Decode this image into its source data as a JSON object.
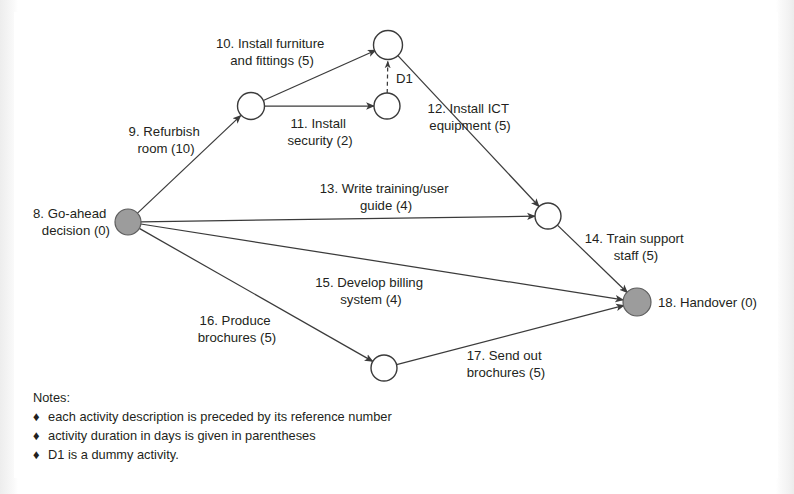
{
  "figure": {
    "type": "activity-on-arrow network diagram",
    "background_color": "#ffffff",
    "line_color": "#3b3b3b",
    "milestone_fill_color": "#9c9c9c",
    "event_fill_color": "#ffffff"
  },
  "nodes": [
    {
      "id": "n8",
      "label": "8. Go-ahead\ndecision (0)",
      "label_line1": "8. Go-ahead",
      "label_line2": "decision (0)",
      "style": "filled",
      "cx": 128,
      "cy": 222,
      "r": 13
    },
    {
      "id": "nA",
      "label": "",
      "style": "open",
      "cx": 251,
      "cy": 106,
      "r": 13.5
    },
    {
      "id": "nB",
      "label": "",
      "style": "open",
      "cx": 388,
      "cy": 45,
      "r": 14.5
    },
    {
      "id": "nC",
      "label": "",
      "style": "open",
      "cx": 387,
      "cy": 106,
      "r": 13
    },
    {
      "id": "nD",
      "label": "",
      "style": "open",
      "cx": 548,
      "cy": 216,
      "r": 13
    },
    {
      "id": "nE",
      "label": "",
      "style": "open",
      "cx": 384,
      "cy": 368,
      "r": 13
    },
    {
      "id": "n18",
      "label": "18. Handover (0)",
      "style": "filled",
      "cx": 637,
      "cy": 302,
      "r": 14
    }
  ],
  "node_labels": [
    {
      "id": "label-8",
      "lines": [
        "8. Go-ahead",
        "decision (0)"
      ],
      "anchor": "end",
      "x": 110,
      "y": 218
    },
    {
      "id": "label-18",
      "lines": [
        "18. Handover (0)"
      ],
      "anchor": "start",
      "x": 658,
      "y": 307
    }
  ],
  "activities": [
    {
      "ref": "9",
      "name": "Refurbish room",
      "duration": 10,
      "lines": [
        "9. Refurbish",
        "room (10)"
      ],
      "from": "n8",
      "to": "nA",
      "label_x": 166,
      "label_y": 136,
      "anchor": "middle"
    },
    {
      "ref": "10",
      "name": "Install furniture and fittings",
      "duration": 5,
      "lines": [
        "10. Install furniture",
        "and fittings (5)"
      ],
      "from": "nA",
      "to": "nB",
      "label_x": 272,
      "label_y": 48,
      "anchor": "middle"
    },
    {
      "ref": "11",
      "name": "Install security",
      "duration": 2,
      "lines": [
        "11. Install",
        "security (2)"
      ],
      "from": "nA",
      "to": "nC",
      "label_x": 320,
      "label_y": 128,
      "anchor": "middle"
    },
    {
      "ref": "12",
      "name": "Install ICT equipment",
      "duration": 5,
      "lines": [
        "12. Install ICT",
        "equipment (5)"
      ],
      "from": "nB",
      "to": "nD",
      "label_x": 470,
      "label_y": 113,
      "anchor": "middle"
    },
    {
      "ref": "13",
      "name": "Write training/user guide",
      "duration": 4,
      "lines": [
        "13. Write training/user",
        "guide (4)"
      ],
      "from": "n8",
      "to": "nD",
      "label_x": 386,
      "label_y": 193,
      "anchor": "middle"
    },
    {
      "ref": "14",
      "name": "Train support staff",
      "duration": 5,
      "lines": [
        "14. Train support",
        "staff (5)"
      ],
      "from": "nD",
      "to": "n18",
      "label_x": 636,
      "label_y": 243,
      "anchor": "middle"
    },
    {
      "ref": "15",
      "name": "Develop billing system",
      "duration": 4,
      "lines": [
        "15. Develop billing",
        "system (4)"
      ],
      "from": "n8",
      "to": "n18",
      "label_x": 371,
      "label_y": 287,
      "anchor": "middle"
    },
    {
      "ref": "16",
      "name": "Produce brochures",
      "duration": 5,
      "lines": [
        "16. Produce",
        "brochures (5)"
      ],
      "from": "n8",
      "to": "nE",
      "label_x": 237,
      "label_y": 325,
      "anchor": "middle"
    },
    {
      "ref": "17",
      "name": "Send out brochures",
      "duration": 5,
      "lines": [
        "17. Send out",
        "brochures (5)"
      ],
      "from": "nE",
      "to": "n18",
      "label_x": 506,
      "label_y": 360,
      "anchor": "middle"
    }
  ],
  "dummy_activity": {
    "id": "D1",
    "label": "D1",
    "from": "nC",
    "to": "nB",
    "label_x": 398,
    "label_y": 81
  },
  "notes": {
    "heading": "Notes:",
    "bullet_glyph": "♦",
    "items": [
      "each activity description is preceded by its reference number",
      "activity duration in days is given in parentheses",
      "D1 is a dummy activity."
    ]
  }
}
